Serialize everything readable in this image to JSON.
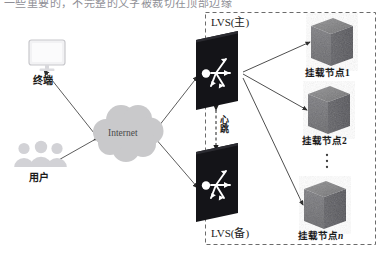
{
  "diagram": {
    "title_clipped": "一些重要的，不完整的文字被裁切在顶部边缘",
    "cluster_box": {
      "label": "dashed-cluster-boundary"
    },
    "colors": {
      "device_dark": "#16161a",
      "server_gray": "#6e6e70",
      "cloud_gray": "#c9c9cb",
      "user_gray": "#cfcfd2",
      "monitor_gray": "#e3e3e6",
      "line": "#3a3a3a",
      "dashed_border": "#6b6b6b"
    },
    "nodes": {
      "terminal": {
        "label": "终端",
        "icon": "monitor-icon"
      },
      "users": {
        "label": "用户",
        "icon": "users-group-icon"
      },
      "internet": {
        "label": "Internet",
        "icon": "cloud-icon"
      },
      "lvs_master": {
        "label": "LVS(主)",
        "icon": "router-switch-icon"
      },
      "lvs_backup": {
        "label": "LVS(备)",
        "icon": "router-switch-icon"
      },
      "heartbeat": {
        "label": "心跳"
      },
      "ellipsis": {
        "label": "⋮"
      }
    },
    "mount_nodes": [
      {
        "label_prefix": "挂载节点",
        "label_suffix": "1",
        "icon": "server-cube-icon"
      },
      {
        "label_prefix": "挂载节点",
        "label_suffix": "2",
        "icon": "server-cube-icon"
      },
      {
        "label_prefix": "挂载节点",
        "label_suffix": "n",
        "icon": "server-cube-icon"
      }
    ]
  }
}
